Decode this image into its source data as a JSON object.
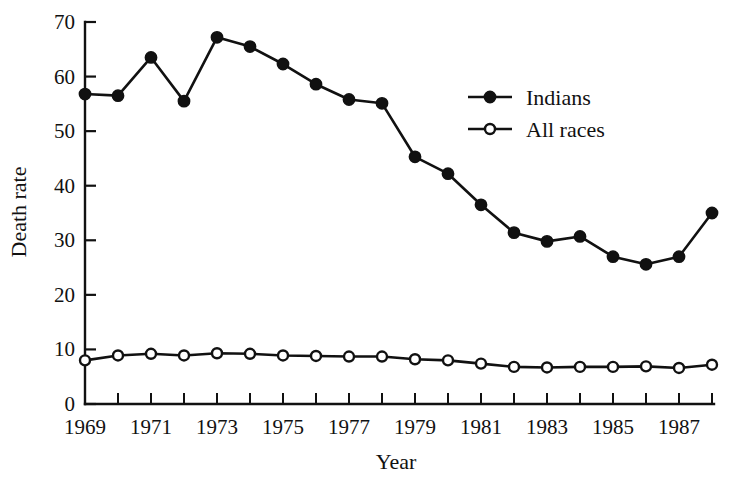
{
  "chart_data": {
    "type": "line",
    "title": "",
    "xlabel": "Year",
    "ylabel": "Death rate",
    "xlim": [
      1969,
      1988
    ],
    "ylim": [
      0,
      70
    ],
    "grid": false,
    "legend_position": "inside-upper-right",
    "x": [
      1969,
      1970,
      1971,
      1972,
      1973,
      1974,
      1975,
      1976,
      1977,
      1978,
      1979,
      1980,
      1981,
      1982,
      1983,
      1984,
      1985,
      1986,
      1987,
      1988
    ],
    "xticklabels": [
      "1969",
      "",
      "1971",
      "",
      "1973",
      "",
      "1975",
      "",
      "1977",
      "",
      "1979",
      "",
      "1981",
      "",
      "1983",
      "",
      "1985",
      "",
      "1987",
      ""
    ],
    "yticks": [
      0,
      10,
      20,
      30,
      40,
      50,
      60,
      70
    ],
    "yticklabels": [
      "0",
      "10",
      "20",
      "30",
      "40",
      "50",
      "60",
      "70"
    ],
    "series": [
      {
        "name": "Indians",
        "marker": "filled-circle",
        "color": "#111111",
        "values": [
          56.8,
          56.5,
          63.5,
          55.5,
          67.2,
          65.5,
          62.3,
          58.6,
          55.8,
          55.1,
          45.3,
          42.2,
          36.5,
          31.4,
          29.8,
          30.7,
          27.0,
          25.6,
          27.0,
          35.0
        ]
      },
      {
        "name": "All races",
        "marker": "open-circle",
        "color": "#111111",
        "values": [
          8.0,
          8.9,
          9.2,
          8.9,
          9.3,
          9.2,
          8.9,
          8.8,
          8.7,
          8.7,
          8.2,
          8.0,
          7.4,
          6.8,
          6.7,
          6.8,
          6.8,
          6.9,
          6.6,
          7.2
        ]
      }
    ]
  },
  "legend": {
    "items": [
      {
        "label": "Indians",
        "marker": "filled-circle"
      },
      {
        "label": "All races",
        "marker": "open-circle"
      }
    ]
  },
  "axes": {
    "y_title": "Death rate",
    "x_title": "Year"
  }
}
